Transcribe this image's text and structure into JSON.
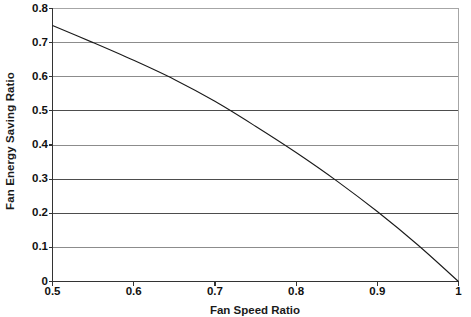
{
  "chart_data": {
    "type": "line",
    "title": "",
    "xlabel": "Fan Speed Ratio",
    "ylabel": "Fan Energy Saving Ratio",
    "xlim": [
      0.5,
      1.0
    ],
    "ylim": [
      0,
      0.8
    ],
    "grid": true,
    "legend": "none",
    "line_color": "#1a1a1a",
    "x_ticks": [
      "0.5",
      "0.6",
      "0.7",
      "0.8",
      "0.9",
      "1"
    ],
    "x_tick_values": [
      0.5,
      0.6,
      0.7,
      0.8,
      0.9,
      1.0
    ],
    "y_ticks": [
      "0",
      "0.1",
      "0.2",
      "0.3",
      "0.4",
      "0.5",
      "0.6",
      "0.7",
      "0.8"
    ],
    "y_tick_values": [
      0,
      0.1,
      0.2,
      0.3,
      0.4,
      0.5,
      0.6,
      0.7,
      0.8
    ],
    "series": [
      {
        "name": "Fan Energy Saving Ratio",
        "x": [
          0.5,
          0.55,
          0.6,
          0.65,
          0.7,
          0.75,
          0.8,
          0.85,
          0.9,
          0.95,
          1.0
        ],
        "values": [
          0.75,
          0.7,
          0.648,
          0.592,
          0.528,
          0.455,
          0.378,
          0.295,
          0.205,
          0.107,
          0.0
        ]
      }
    ]
  },
  "axes": {
    "y_title": "Fan Energy Saving Ratio",
    "x_title": "Fan Speed Ratio"
  }
}
